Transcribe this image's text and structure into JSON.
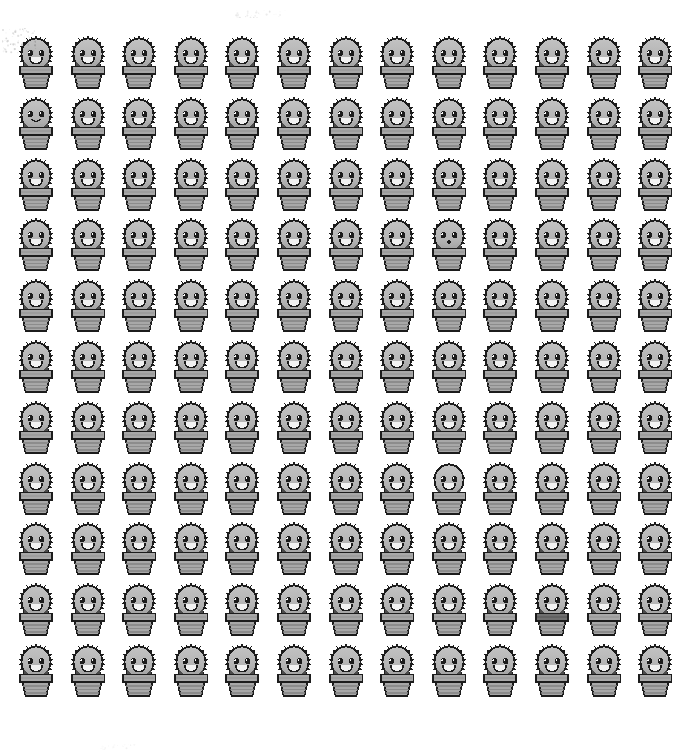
{
  "scene": {
    "title": "Cactus sprite grid",
    "background_color": "#ffffff",
    "width": 697,
    "height": 756,
    "description": "Repeating grid of grayscale kawaii cactus-in-a-pot sprites"
  },
  "grid": {
    "columns": 13,
    "rows": 11,
    "origin_x": 14,
    "origin_y": 33,
    "column_pitch": 51.6,
    "row_pitch": 60.8,
    "cell_width": 44,
    "cell_height": 57,
    "total_sprites": 143
  },
  "palette": {
    "outline": "#1c1c1c",
    "body_light": "#c2c2c2",
    "body_mid": "#b4b4b4",
    "body_shadow": "#a2a2a2",
    "pot_light": "#a8a8a8",
    "pot_mid": "#9a9a9a",
    "pot_dark": "#858585",
    "pot_darker": "#6f6f6f",
    "highlight": "#ffffff",
    "eye": "#1c1c1c",
    "mouth_fill": "#f2f2f2"
  },
  "sprite": {
    "name": "cactus-in-pot",
    "parts": [
      "spiky-round-body",
      "left-eye",
      "right-eye",
      "open-smile-mouth",
      "striped-flower-pot",
      "pot-rim"
    ],
    "default_face": "open-smile"
  },
  "face_variants": {
    "open-smile": "Wide open D-shaped smile with white fill",
    "closed-smile": "Small curved closed smile",
    "dot-mouth": "Tiny round dot mouth, no smile"
  },
  "anomalies": [
    {
      "row": 2,
      "column": 1,
      "type": "closed-smile",
      "note": "smaller closed curved mouth"
    },
    {
      "row": 4,
      "column": 9,
      "type": "dot-mouth",
      "note": "tiny dot mouth instead of smile"
    },
    {
      "row": 8,
      "column": 9,
      "type": "smooth-edge",
      "note": "reduced spikes on left side"
    },
    {
      "row": 10,
      "column": 11,
      "type": "dark-pot-rim",
      "note": "noticeably darker pot rim"
    }
  ],
  "artifacts": [
    {
      "name": "smudge-top-left",
      "x": 2,
      "y": 28,
      "width": 34,
      "height": 26,
      "opacity": 0.3
    },
    {
      "name": "speck-upper-mid",
      "x": 232,
      "y": 10,
      "width": 56,
      "height": 8,
      "opacity": 0.16
    },
    {
      "name": "speck-mid-right",
      "x": 406,
      "y": 408,
      "width": 10,
      "height": 8,
      "opacity": 0.4
    },
    {
      "name": "speck-bottom",
      "x": 100,
      "y": 744,
      "width": 40,
      "height": 6,
      "opacity": 0.1
    }
  ]
}
